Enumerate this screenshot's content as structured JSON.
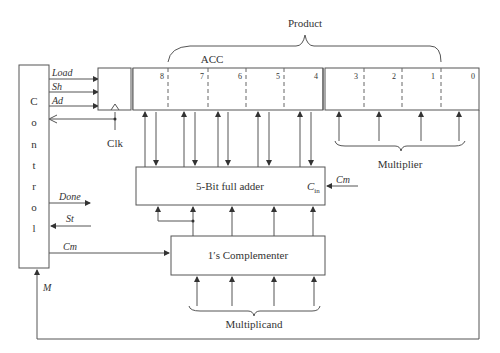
{
  "diagram": {
    "title_labels": {
      "product": "Product",
      "acc": "ACC",
      "multiplier": "Multiplier",
      "multiplicand": "Multiplicand"
    },
    "control": {
      "letters": [
        "C",
        "o",
        "n",
        "t",
        "r",
        "o",
        "l"
      ],
      "outputs": {
        "load": "Load",
        "sh": "Sh",
        "ad": "Ad",
        "done": "Done",
        "cm": "Cm"
      },
      "inputs": {
        "st": "St",
        "m": "M",
        "clk": "Clk"
      }
    },
    "register": {
      "acc_bits": [
        "8",
        "7",
        "6",
        "5",
        "4"
      ],
      "multiplier_bits": [
        "3",
        "2",
        "1",
        "0"
      ]
    },
    "adder": {
      "label": "5-Bit full adder",
      "carry_in_main": "C",
      "carry_in_sub": "in",
      "carry_in_signal": "Cm"
    },
    "complementer": {
      "label": "1′s Complementer"
    }
  }
}
